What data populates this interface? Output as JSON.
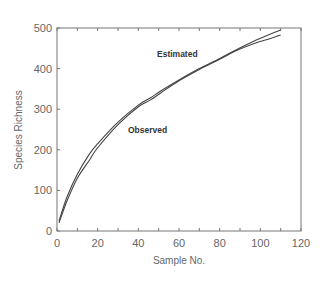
{
  "chart_data": {
    "type": "line",
    "title": "",
    "xlabel": "Sample No.",
    "ylabel": "Species Richness",
    "xlim": [
      0,
      120
    ],
    "ylim": [
      0,
      500
    ],
    "xticks": [
      0,
      20,
      40,
      60,
      80,
      100,
      120
    ],
    "yticks": [
      0,
      100,
      200,
      300,
      400,
      500
    ],
    "x_minor_step": 10,
    "grid": false,
    "legend": "none (inline annotations)",
    "annotations": [
      {
        "text": "Estimated",
        "x": 60,
        "y": 435
      },
      {
        "text": "Observed",
        "x": 45,
        "y": 245
      }
    ],
    "series": [
      {
        "name": "Estimated",
        "x": [
          1,
          5,
          10,
          16,
          20,
          30,
          40,
          46,
          51,
          60,
          70,
          80,
          88,
          97,
          105,
          110
        ],
        "y": [
          25,
          85,
          140,
          190,
          215,
          268,
          310,
          328,
          345,
          372,
          400,
          425,
          446,
          468,
          485,
          495
        ]
      },
      {
        "name": "Observed",
        "x": [
          1,
          5,
          10,
          16,
          20,
          30,
          40,
          46,
          51,
          60,
          70,
          80,
          88,
          97,
          105,
          110
        ],
        "y": [
          20,
          75,
          130,
          175,
          205,
          262,
          306,
          323,
          340,
          370,
          398,
          423,
          444,
          462,
          474,
          483
        ]
      }
    ]
  },
  "labels": {
    "x_title": "Sample No.",
    "y_title": "Species Richness",
    "estimated": "Estimated",
    "observed": "Observed"
  }
}
